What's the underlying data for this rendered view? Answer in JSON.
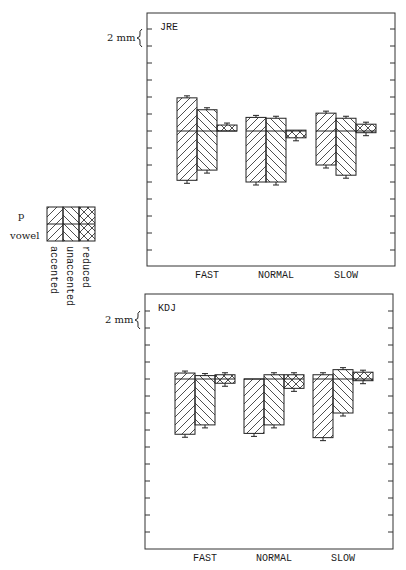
{
  "legend": {
    "top_label": "p",
    "bottom_label": "vowel",
    "entries": [
      {
        "label": "accented",
        "pattern": "hatch-forward"
      },
      {
        "label": "unaccented",
        "pattern": "hatch-back"
      },
      {
        "label": "reduced",
        "pattern": "cross-hatch"
      }
    ]
  },
  "scale_label": "2 mm",
  "chart_data": [
    {
      "type": "bar",
      "title": "JRE",
      "categories": [
        "FAST",
        "NORMAL",
        "SLOW"
      ],
      "ylabel": "2 mm per tick (p above baseline, vowel below baseline)",
      "units": "mm",
      "grid": false,
      "series": [
        {
          "name": "accented",
          "p_values": [
            3.9,
            1.6,
            2.1
          ],
          "vowel_values": [
            -5.8,
            -6.0,
            -4.0
          ]
        },
        {
          "name": "unaccented",
          "p_values": [
            2.5,
            1.5,
            1.5
          ],
          "vowel_values": [
            -4.6,
            -6.0,
            -5.2
          ]
        },
        {
          "name": "reduced",
          "p_values": [
            0.7,
            0.1,
            0.8
          ],
          "vowel_values": [
            0.0,
            -0.8,
            -0.2
          ]
        }
      ]
    },
    {
      "type": "bar",
      "title": "KDJ",
      "categories": [
        "FAST",
        "NORMAL",
        "SLOW"
      ],
      "ylabel": "2 mm per tick (p above baseline, vowel below baseline)",
      "units": "mm",
      "grid": false,
      "series": [
        {
          "name": "accented",
          "p_values": [
            0.7,
            0.0,
            0.5
          ],
          "vowel_values": [
            -6.5,
            -6.4,
            -6.9
          ]
        },
        {
          "name": "unaccented",
          "p_values": [
            0.4,
            0.5,
            1.1
          ],
          "vowel_values": [
            -5.4,
            -5.4,
            -4.0
          ]
        },
        {
          "name": "reduced",
          "p_values": [
            0.5,
            0.5,
            0.8
          ],
          "vowel_values": [
            -0.5,
            -1.1,
            -0.2
          ]
        }
      ]
    }
  ]
}
